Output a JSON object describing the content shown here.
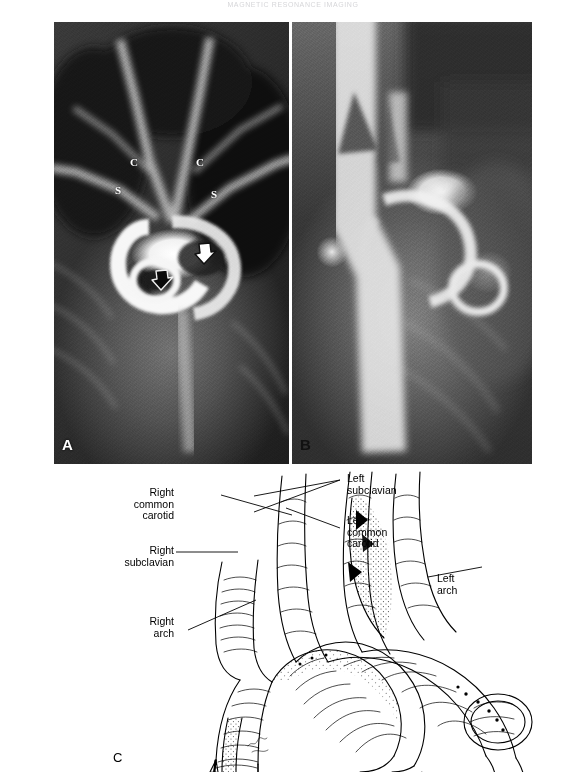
{
  "page": {
    "running_head": "MAGNETIC RESONANCE IMAGING"
  },
  "figure": {
    "panels": [
      {
        "id": "A",
        "label": "A",
        "type": "radiograph",
        "annotations": [
          {
            "name": "right-common-carotid",
            "text": "C"
          },
          {
            "name": "left-common-carotid",
            "text": "C"
          },
          {
            "name": "right-subclavian",
            "text": "S"
          },
          {
            "name": "left-subclavian",
            "text": "S"
          },
          {
            "name": "white-arrow",
            "text": ""
          },
          {
            "name": "black-arrow",
            "text": ""
          }
        ]
      },
      {
        "id": "B",
        "label": "B",
        "type": "radiograph",
        "annotations": []
      },
      {
        "id": "C",
        "label": "C",
        "type": "line-drawing",
        "annotations": []
      }
    ]
  },
  "diagram": {
    "labels": [
      {
        "name": "right-common-carotid-label",
        "lines": [
          "Right",
          "common",
          "carotid"
        ],
        "align": "right"
      },
      {
        "name": "right-subclavian-label",
        "lines": [
          "Right",
          "subclavian"
        ],
        "align": "right"
      },
      {
        "name": "right-arch-label",
        "lines": [
          "Right",
          "arch"
        ],
        "align": "right"
      },
      {
        "name": "left-subclavian-label",
        "lines": [
          "Left",
          "subclavian"
        ],
        "align": "left"
      },
      {
        "name": "left-common-carotid-label",
        "lines": [
          "Left",
          "common",
          "carotid"
        ],
        "align": "left"
      },
      {
        "name": "left-arch-label",
        "lines": [
          "Left",
          "arch"
        ],
        "align": "left"
      }
    ]
  },
  "colors": {
    "ink": "#000000",
    "paper": "#ffffff",
    "annotation_white": "#ffffff",
    "annotation_black": "#000000"
  }
}
